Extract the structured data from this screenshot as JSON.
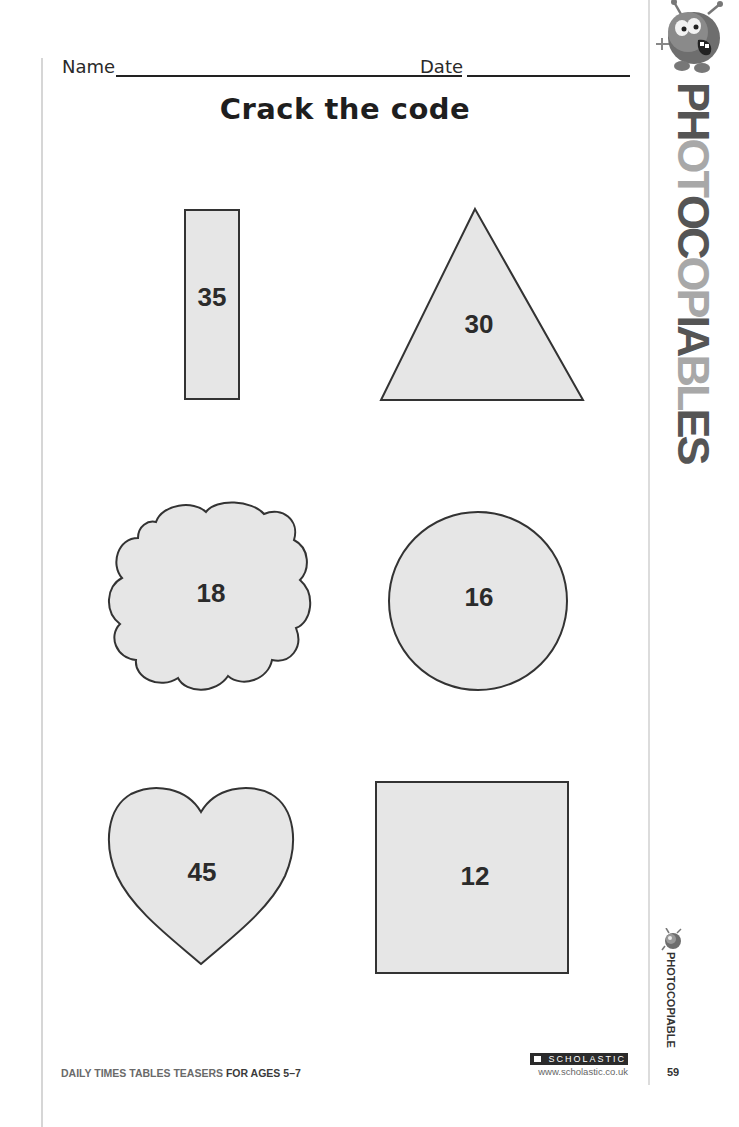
{
  "header": {
    "name_label": "Name",
    "date_label": "Date",
    "title": "Crack the code"
  },
  "shapes": [
    {
      "shape": "rectangle",
      "value": "35"
    },
    {
      "shape": "triangle",
      "value": "30"
    },
    {
      "shape": "cloud",
      "value": "18"
    },
    {
      "shape": "circle",
      "value": "16"
    },
    {
      "shape": "heart",
      "value": "45"
    },
    {
      "shape": "square",
      "value": "12"
    }
  ],
  "side_banner": {
    "icon": "monster-mascot-icon",
    "letters": [
      "P",
      "H",
      "O",
      "T",
      "O",
      "C",
      "O",
      "P",
      "I",
      "A",
      "B",
      "L",
      "E",
      "S"
    ],
    "letter_colors": [
      "#555555",
      "#555555",
      "#a8a8a8",
      "#a8a8a8",
      "#555555",
      "#555555",
      "#a8a8a8",
      "#a8a8a8",
      "#555555",
      "#555555",
      "#a8a8a8",
      "#a8a8a8",
      "#555555",
      "#555555"
    ]
  },
  "side_label": {
    "icon": "monster-mascot-icon",
    "text": "PHOTOCOPIABLE",
    "page_number": "59"
  },
  "footer": {
    "series": "DAILY TIMES TABLES TEASERS",
    "ages": "FOR AGES 5–7",
    "publisher": "SCHOLASTIC",
    "url": "www.scholastic.co.uk"
  },
  "colors": {
    "shape_fill": "#e6e6e6",
    "shape_stroke": "#333333"
  }
}
